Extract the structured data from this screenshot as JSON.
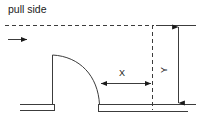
{
  "diagram": {
    "title": "pull side",
    "labels": {
      "x_dimension": "X",
      "y_dimension": "Y"
    },
    "colors": {
      "line": "#3c3c3c",
      "text": "#1a1a1a",
      "background": "#ffffff"
    },
    "elements": {
      "approach_arrow": "approach-direction-arrow",
      "door_leaf": "door-leaf-line",
      "swing_arc": "door-swing-arc",
      "wall_left": "wall-segment-left",
      "wall_right": "wall-segment-right",
      "reference_line_top": "dashed-reference-line-horizontal",
      "reference_line_right": "dashed-reference-line-vertical",
      "x_dimension_line": "x-dimension-line",
      "y_dimension_line": "y-dimension-line"
    }
  }
}
